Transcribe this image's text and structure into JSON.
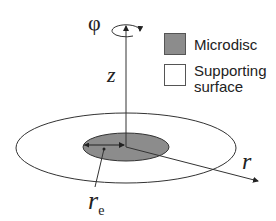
{
  "diagram": {
    "labels": {
      "phi": "φ",
      "z": "z",
      "r": "r",
      "re_main": "r",
      "re_sub": "e"
    },
    "legend": [
      {
        "label": "Microdisc",
        "color": "#8c8c8c"
      },
      {
        "label": "Supporting",
        "label2": "surface",
        "color": "#ffffff"
      }
    ],
    "colors": {
      "line": "#333333",
      "microdisc_fill": "#8c8c8c",
      "surface_fill": "#ffffff"
    }
  }
}
